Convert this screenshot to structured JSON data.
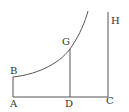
{
  "diagram": {
    "type": "geometric-figure",
    "colors": {
      "line": "#555555",
      "text": "#333333",
      "background": "#ffffff"
    },
    "points": {
      "A": {
        "label": "A",
        "x": 13,
        "y": 97
      },
      "B": {
        "label": "B",
        "x": 13,
        "y": 77
      },
      "D": {
        "label": "D",
        "x": 70,
        "y": 97
      },
      "G": {
        "label": "G",
        "x": 70,
        "y": 49
      },
      "C": {
        "label": "C",
        "x": 108,
        "y": 97
      },
      "H": {
        "label": "H",
        "x": 108,
        "y": 12
      }
    },
    "segments": [
      {
        "name": "AB",
        "from": "A",
        "to": "B"
      },
      {
        "name": "AC",
        "from": "A",
        "to": "C"
      },
      {
        "name": "DG",
        "from": "D",
        "to": "G"
      },
      {
        "name": "CH",
        "from": "C",
        "to": "H"
      }
    ],
    "curve": {
      "name": "curve-BG",
      "from": "B",
      "through": "G",
      "end": {
        "x": 88,
        "y": 11
      }
    }
  }
}
